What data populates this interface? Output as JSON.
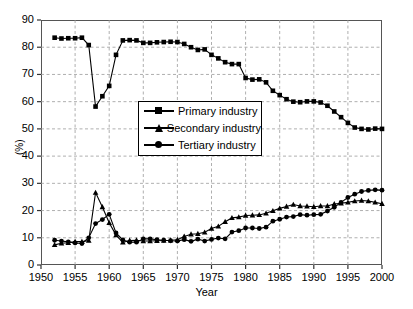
{
  "chart_data": {
    "type": "line",
    "title": "",
    "xlabel": "Year",
    "ylabel": "(%)",
    "xlim": [
      1950,
      2000
    ],
    "ylim": [
      0,
      90
    ],
    "xticks": [
      1950,
      1955,
      1960,
      1965,
      1970,
      1975,
      1980,
      1985,
      1990,
      1995,
      2000
    ],
    "yticks": [
      0,
      10,
      20,
      30,
      40,
      50,
      60,
      70,
      80,
      90
    ],
    "grid": true,
    "legend_position": "center-left",
    "x": [
      1952,
      1953,
      1954,
      1955,
      1956,
      1957,
      1958,
      1959,
      1960,
      1961,
      1962,
      1963,
      1964,
      1965,
      1966,
      1967,
      1968,
      1969,
      1970,
      1971,
      1972,
      1973,
      1974,
      1975,
      1976,
      1977,
      1978,
      1979,
      1980,
      1981,
      1982,
      1983,
      1984,
      1985,
      1986,
      1987,
      1988,
      1989,
      1990,
      1991,
      1992,
      1993,
      1994,
      1995,
      1996,
      1997,
      1998,
      1999,
      2000
    ],
    "series": [
      {
        "name": "Primary industry",
        "marker": "square",
        "values": [
          83.5,
          83.2,
          83.3,
          83.3,
          83.5,
          80.8,
          58.2,
          62.0,
          65.8,
          77.2,
          82.5,
          82.6,
          82.5,
          81.6,
          81.6,
          81.8,
          81.9,
          82.0,
          81.9,
          81.2,
          80.0,
          79.0,
          79.2,
          77.2,
          75.9,
          74.5,
          73.8,
          73.8,
          68.7,
          68.1,
          68.2,
          67.1,
          64.0,
          62.4,
          60.9,
          60.0,
          59.8,
          60.1,
          60.1,
          59.7,
          58.5,
          56.4,
          54.3,
          52.2,
          50.5,
          50.0,
          49.8,
          50.1,
          50.0
        ]
      },
      {
        "name": "Secondary industry",
        "marker": "triangle",
        "values": [
          7.4,
          8.0,
          8.2,
          8.6,
          8.6,
          9.0,
          26.6,
          21.3,
          15.5,
          11.0,
          8.3,
          9.0,
          9.1,
          8.8,
          8.8,
          8.9,
          9.0,
          9.1,
          9.3,
          10.5,
          11.3,
          11.5,
          12.0,
          13.4,
          14.2,
          15.9,
          17.3,
          17.6,
          18.2,
          18.3,
          18.4,
          19.0,
          19.9,
          20.8,
          21.5,
          22.2,
          21.7,
          21.6,
          21.4,
          21.7,
          21.7,
          22.4,
          22.7,
          23.0,
          23.5,
          23.7,
          23.5,
          23.0,
          22.5
        ]
      },
      {
        "name": "Tertiary industry",
        "marker": "circle",
        "values": [
          9.1,
          8.8,
          8.5,
          8.1,
          7.9,
          10.0,
          15.2,
          16.7,
          18.6,
          11.8,
          9.2,
          8.4,
          8.4,
          9.6,
          9.6,
          9.3,
          9.1,
          8.9,
          8.8,
          9.3,
          8.7,
          9.5,
          8.8,
          9.4,
          9.9,
          9.6,
          12.1,
          12.6,
          13.6,
          13.6,
          13.4,
          13.9,
          16.1,
          16.8,
          17.6,
          17.8,
          18.5,
          18.3,
          18.5,
          18.6,
          19.8,
          21.2,
          23.0,
          24.8,
          26.0,
          27.0,
          27.4,
          27.6,
          27.5
        ]
      }
    ]
  }
}
